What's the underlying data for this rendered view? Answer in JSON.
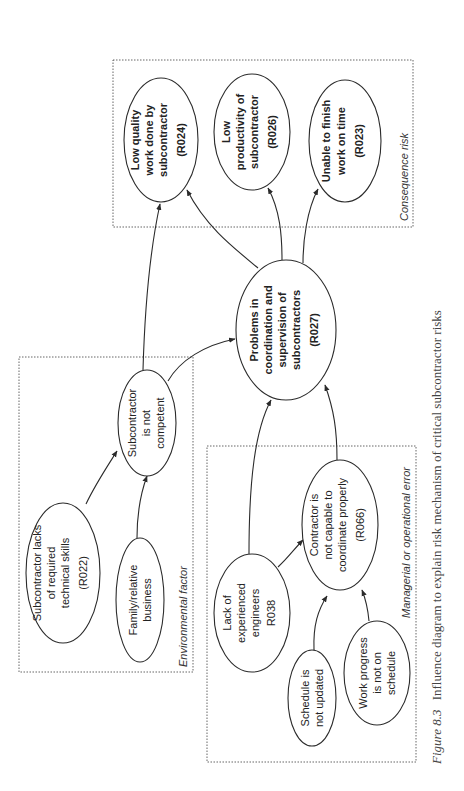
{
  "groups": {
    "consequence": "Consequence risk",
    "environmental": "Environmental factor",
    "managerial": "Managerial or operational error"
  },
  "nodes": {
    "r024": [
      "Low quality",
      "work done by",
      "subcontractor",
      "(R024)"
    ],
    "r026": [
      "Low",
      "productivity of",
      "subcontractor",
      "(R026)"
    ],
    "r023": [
      "Unable to finish",
      "work on time",
      "(R023)"
    ],
    "r027": [
      "Problems in",
      "coordination and",
      "supervision of",
      "subcontractors",
      "(R027)"
    ],
    "not_competent": [
      "Subcontractor",
      "is not",
      "competent"
    ],
    "r022": [
      "Subcontractor lacks",
      "of required",
      "technical skills",
      "(R022)"
    ],
    "family": [
      "Family/relative",
      "business"
    ],
    "r066": [
      "Contractor is",
      "not capable to",
      "coordinate properly",
      "(R066)"
    ],
    "r038": [
      "Lack of",
      "experienced",
      "engineers",
      "R038"
    ],
    "schedule": [
      "Schedule is",
      "not updated"
    ],
    "progress": [
      "Work progress",
      "is not on",
      "schedule"
    ]
  },
  "caption": {
    "figure": "Figure 8.3",
    "text": "Influence diagram to explain risk mechanism of critical subcontractor risks"
  }
}
